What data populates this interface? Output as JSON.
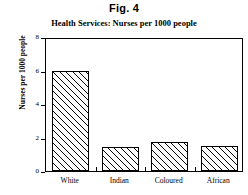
{
  "figure": {
    "title": "Fig. 4",
    "subtitle": "Health Services: Nurses per 1000 people"
  },
  "chart_data": {
    "type": "bar",
    "title": "Health Services: Nurses per 1000 people",
    "figure_label": "Fig. 4",
    "categories": [
      "White",
      "Indian",
      "Coloured",
      "African"
    ],
    "values": [
      6.0,
      1.45,
      1.75,
      1.5
    ],
    "xlabel": "",
    "ylabel": "Nurses per 1000 people",
    "ylim": [
      0,
      8
    ],
    "yticks": [
      0,
      2,
      4,
      6,
      8
    ],
    "ytick_labels": [
      "0",
      "2",
      "4",
      "6",
      "8"
    ],
    "grid": false,
    "legend": false,
    "bar_style": {
      "fill": "diagonal-hatch",
      "edge_color": "#000000",
      "face_color": "#ffffff"
    }
  }
}
